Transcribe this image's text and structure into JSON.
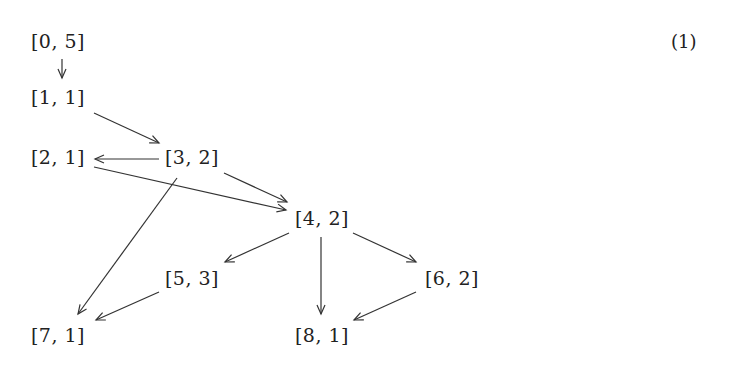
{
  "equation_number": "(1)",
  "nodes": [
    {
      "id": "n0",
      "label": "[0, 5]",
      "x": 58,
      "y": 41
    },
    {
      "id": "n1",
      "label": "[1, 1]",
      "x": 58,
      "y": 97
    },
    {
      "id": "n2",
      "label": "[2, 1]",
      "x": 58,
      "y": 157
    },
    {
      "id": "n3",
      "label": "[3, 2]",
      "x": 192,
      "y": 157
    },
    {
      "id": "n4",
      "label": "[4, 2]",
      "x": 322,
      "y": 218
    },
    {
      "id": "n5",
      "label": "[5, 3]",
      "x": 192,
      "y": 278
    },
    {
      "id": "n6",
      "label": "[6, 2]",
      "x": 452,
      "y": 278
    },
    {
      "id": "n7",
      "label": "[7, 1]",
      "x": 58,
      "y": 335
    },
    {
      "id": "n8",
      "label": "[8, 1]",
      "x": 322,
      "y": 335
    }
  ],
  "edges": [
    {
      "from": "[0, 5]",
      "to": "[1, 1]",
      "x1": 62,
      "y1": 59,
      "x2": 62,
      "y2": 78
    },
    {
      "from": "[1, 1]",
      "to": "[3, 2]",
      "x1": 94,
      "y1": 113,
      "x2": 159,
      "y2": 143
    },
    {
      "from": "[3, 2]",
      "to": "[2, 1]",
      "x1": 159,
      "y1": 159,
      "x2": 95,
      "y2": 159
    },
    {
      "from": "[2, 1]",
      "to": "[4, 2]",
      "x1": 94,
      "y1": 167,
      "x2": 286,
      "y2": 210
    },
    {
      "from": "[3, 2]",
      "to": "[4, 2]",
      "x1": 224,
      "y1": 173,
      "x2": 287,
      "y2": 202
    },
    {
      "from": "[3, 2]",
      "to": "[7, 1]",
      "x1": 177,
      "y1": 178,
      "x2": 78,
      "y2": 314
    },
    {
      "from": "[4, 2]",
      "to": "[5, 3]",
      "x1": 289,
      "y1": 233,
      "x2": 225,
      "y2": 262
    },
    {
      "from": "[4, 2]",
      "to": "[8, 1]",
      "x1": 321,
      "y1": 237,
      "x2": 321,
      "y2": 314
    },
    {
      "from": "[4, 2]",
      "to": "[6, 2]",
      "x1": 353,
      "y1": 233,
      "x2": 416,
      "y2": 262
    },
    {
      "from": "[5, 3]",
      "to": "[7, 1]",
      "x1": 159,
      "y1": 292,
      "x2": 96,
      "y2": 320
    },
    {
      "from": "[6, 2]",
      "to": "[8, 1]",
      "x1": 416,
      "y1": 292,
      "x2": 354,
      "y2": 320
    }
  ]
}
